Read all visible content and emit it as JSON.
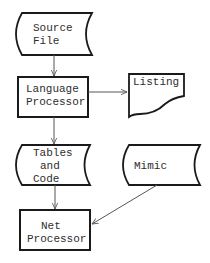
{
  "diagram": {
    "type": "flowchart",
    "nodes": {
      "source_file": {
        "shape": "stored-data",
        "line1": "Source",
        "line2": "File"
      },
      "language_processor": {
        "shape": "process",
        "line1": "Language",
        "line2": "Processor"
      },
      "listing": {
        "shape": "document",
        "line1": "Listing"
      },
      "tables_and_code": {
        "shape": "stored-data",
        "line1": "Tables",
        "line2": "and",
        "line3": "Code"
      },
      "mimic": {
        "shape": "stored-data",
        "line1": "Mimic"
      },
      "net_processor": {
        "shape": "process",
        "line1": "Net",
        "line2": "Processor"
      }
    },
    "edges": [
      {
        "from": "Source File",
        "to": "Language Processor"
      },
      {
        "from": "Language Processor",
        "to": "Listing"
      },
      {
        "from": "Language Processor",
        "to": "Tables and Code"
      },
      {
        "from": "Tables and Code",
        "to": "Net Processor"
      },
      {
        "from": "Mimic",
        "to": "Net Processor"
      }
    ],
    "colors": {
      "stroke": "#1a1a1a",
      "edge": "#555555",
      "text": "#2e2e2e",
      "background": "#ffffff"
    }
  }
}
